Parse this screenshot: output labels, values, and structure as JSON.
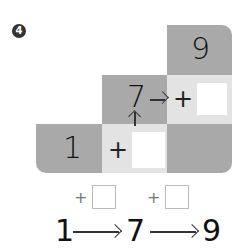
{
  "problem_number": "4",
  "grid": {
    "top_right_value": "9",
    "middle_value": "7",
    "bottom_left_value": "1",
    "plus_sign": "+",
    "arrow_right": "→",
    "arrow_up": "↑"
  },
  "sequence": {
    "start": "1",
    "middle": "7",
    "end": "9",
    "step1_op": "+",
    "step2_op": "+"
  },
  "colors": {
    "dark_cell": "#a9a9a9",
    "light_cell": "#e3e3e3",
    "answer_box": "#ffffff"
  }
}
